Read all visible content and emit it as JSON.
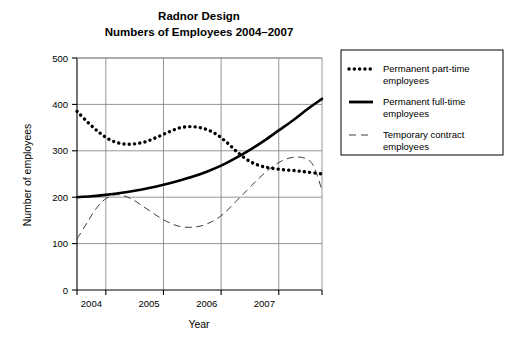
{
  "chart_data": {
    "type": "line",
    "title": "Radnor Design",
    "subtitle": "Numbers of Employees 2004–2007",
    "xlabel": "Year",
    "ylabel": "Number of employees",
    "xlim": [
      2003.5,
      2007.75
    ],
    "ylim": [
      0,
      500
    ],
    "ytick_values": [
      0,
      100,
      200,
      300,
      400,
      500
    ],
    "ytick_labels": [
      "0",
      "100",
      "200",
      "300",
      "400",
      "500"
    ],
    "xtick_values": [
      2003.5,
      2004.0,
      2004.5,
      2005.0,
      2005.5,
      2006.0,
      2006.5,
      2007.0,
      2007.5,
      2007.75
    ],
    "xtick_labels": [
      "2004",
      "2005",
      "2006",
      "2007"
    ],
    "xtick_label_positions": [
      2003.75,
      2004.75,
      2005.75,
      2006.75
    ],
    "grid": true,
    "legend_position": "right",
    "series": [
      {
        "name": "Permanent part-time employees",
        "style": "dotted",
        "x": [
          2003.5,
          2003.7,
          2003.9,
          2004.1,
          2004.3,
          2004.5,
          2004.7,
          2004.9,
          2005.1,
          2005.3,
          2005.5,
          2005.7,
          2005.9,
          2006.1,
          2006.3,
          2006.5,
          2006.7,
          2006.9,
          2007.1,
          2007.3,
          2007.5,
          2007.75
        ],
        "values": [
          385,
          360,
          338,
          322,
          315,
          315,
          320,
          330,
          341,
          350,
          352,
          348,
          337,
          318,
          295,
          277,
          267,
          262,
          259,
          257,
          254,
          250
        ]
      },
      {
        "name": "Permanent full-time employees",
        "style": "solid",
        "x": [
          2003.5,
          2003.75,
          2004.0,
          2004.25,
          2004.5,
          2004.75,
          2005.0,
          2005.25,
          2005.5,
          2005.75,
          2006.0,
          2006.25,
          2006.5,
          2006.75,
          2007.0,
          2007.25,
          2007.5,
          2007.75
        ],
        "values": [
          200,
          202,
          205,
          209,
          214,
          220,
          227,
          235,
          244,
          255,
          268,
          284,
          302,
          322,
          344,
          366,
          390,
          412
        ]
      },
      {
        "name": "Temporary contract employees",
        "style": "dashed",
        "x": [
          2003.5,
          2003.65,
          2003.8,
          2003.95,
          2004.1,
          2004.25,
          2004.45,
          2004.65,
          2004.85,
          2005.05,
          2005.25,
          2005.45,
          2005.65,
          2005.85,
          2006.05,
          2006.25,
          2006.45,
          2006.65,
          2006.85,
          2007.05,
          2007.25,
          2007.45,
          2007.6,
          2007.75
        ],
        "values": [
          110,
          140,
          170,
          192,
          203,
          205,
          196,
          180,
          163,
          148,
          138,
          135,
          138,
          148,
          165,
          190,
          215,
          240,
          262,
          278,
          286,
          284,
          268,
          215
        ]
      }
    ]
  },
  "legend": {
    "entries": [
      {
        "label_line1": "Permanent part-time",
        "label_line2": "employees",
        "style": "dotted"
      },
      {
        "label_line1": "Permanent full-time",
        "label_line2": "employees",
        "style": "solid"
      },
      {
        "label_line1": "Temporary contract",
        "label_line2": "employees",
        "style": "dashed"
      }
    ]
  }
}
